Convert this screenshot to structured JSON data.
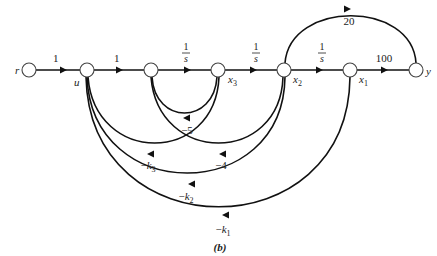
{
  "figure": {
    "caption": "(b)",
    "type": "signal-flow-graph"
  },
  "nodes": [
    {
      "id": "r",
      "label": "r",
      "x": 29,
      "y": 70
    },
    {
      "id": "u",
      "label": "u",
      "x": 87,
      "y": 70
    },
    {
      "id": "n3",
      "label": "",
      "x": 151,
      "y": 70
    },
    {
      "id": "x3",
      "label": "x3",
      "x": 218,
      "y": 70
    },
    {
      "id": "x2",
      "label": "x2",
      "x": 284,
      "y": 70
    },
    {
      "id": "x1",
      "label": "x1",
      "x": 350,
      "y": 70
    },
    {
      "id": "y",
      "label": "y",
      "x": 416,
      "y": 70
    }
  ],
  "forward_branches": [
    {
      "from": "r",
      "to": "u",
      "gain": "1"
    },
    {
      "from": "u",
      "to": "n3",
      "gain": "1"
    },
    {
      "from": "n3",
      "to": "x3",
      "gain_num": "1",
      "gain_den": "s"
    },
    {
      "from": "x3",
      "to": "x2",
      "gain_num": "1",
      "gain_den": "s"
    },
    {
      "from": "x2",
      "to": "x1",
      "gain_num": "1",
      "gain_den": "s"
    },
    {
      "from": "x1",
      "to": "y",
      "gain": "100"
    },
    {
      "from": "x2",
      "to": "y",
      "gain": "20"
    }
  ],
  "feedback_branches": [
    {
      "from": "x3",
      "to": "n3",
      "gain": "−5"
    },
    {
      "from": "x3",
      "to": "u",
      "gain": "−k",
      "sub": "3"
    },
    {
      "from": "x2",
      "to": "n3",
      "gain": "−4"
    },
    {
      "from": "x2",
      "to": "u",
      "gain": "−k",
      "sub": "2"
    },
    {
      "from": "x1",
      "to": "u",
      "gain": "−k",
      "sub": "1"
    }
  ]
}
